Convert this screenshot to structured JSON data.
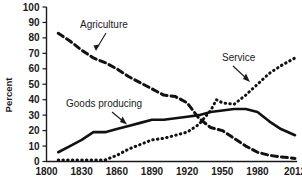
{
  "chart_data": {
    "type": "line",
    "title": "",
    "subtitle": "",
    "xlabel": "",
    "ylabel": "Percent",
    "xlim": [
      1800,
      2012
    ],
    "ylim": [
      0,
      100
    ],
    "grid": false,
    "legend_position": "inline-annotations",
    "x_ticks": [
      "1800",
      "1830",
      "1860",
      "1890",
      "1920",
      "1950",
      "1980",
      "2012"
    ],
    "x_tick_values": [
      1800,
      1830,
      1860,
      1890,
      1920,
      1950,
      1980,
      2012
    ],
    "y_ticks": [
      "0",
      "10",
      "20",
      "30",
      "40",
      "50",
      "60",
      "70",
      "80",
      "90",
      "100"
    ],
    "y_tick_values": [
      0,
      10,
      20,
      30,
      40,
      50,
      60,
      70,
      80,
      90,
      100
    ],
    "series": [
      {
        "name": "Agriculture",
        "style": "dashed",
        "color": "#111111",
        "x": [
          1810,
          1820,
          1830,
          1840,
          1850,
          1860,
          1870,
          1880,
          1890,
          1900,
          1910,
          1920,
          1930,
          1940,
          1950,
          1960,
          1970,
          1980,
          1990,
          2000,
          2012
        ],
        "values": [
          83,
          78,
          72,
          67,
          64,
          60,
          55,
          51,
          47,
          43,
          42,
          38,
          28,
          22,
          20,
          15,
          10,
          6,
          4,
          3,
          2
        ]
      },
      {
        "name": "Goods producing",
        "style": "solid",
        "color": "#111111",
        "x": [
          1810,
          1820,
          1830,
          1840,
          1850,
          1860,
          1870,
          1880,
          1890,
          1900,
          1910,
          1920,
          1930,
          1940,
          1950,
          1960,
          1970,
          1980,
          1990,
          2000,
          2012
        ],
        "values": [
          6,
          10,
          14,
          19,
          19,
          21,
          23,
          25,
          27,
          27,
          28,
          29,
          30,
          32,
          33,
          34,
          34,
          32,
          26,
          21,
          17
        ]
      },
      {
        "name": "Service",
        "style": "dotted",
        "color": "#111111",
        "x": [
          1810,
          1820,
          1830,
          1840,
          1850,
          1860,
          1870,
          1880,
          1890,
          1900,
          1910,
          1920,
          1930,
          1940,
          1945,
          1950,
          1960,
          1970,
          1980,
          1990,
          2000,
          2012
        ],
        "values": [
          1,
          1,
          1,
          1,
          1,
          4,
          8,
          11,
          14,
          15,
          17,
          19,
          24,
          33,
          40,
          38,
          37,
          43,
          50,
          57,
          62,
          67
        ]
      }
    ],
    "annotations": [
      {
        "label": "Agriculture",
        "target_series": "Agriculture"
      },
      {
        "label": "Goods producing",
        "target_series": "Goods producing"
      },
      {
        "label": "Service",
        "target_series": "Service"
      }
    ]
  }
}
